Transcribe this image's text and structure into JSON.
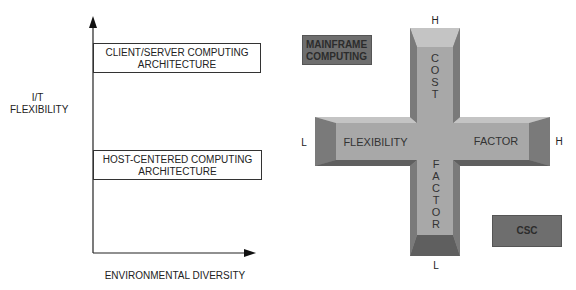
{
  "left_chart": {
    "y_axis_label_line1": "I/T",
    "y_axis_label_line2": "FLEXIBILITY",
    "x_axis_label": "ENVIRONMENTAL DIVERSITY",
    "top_box": {
      "line1": "CLIENT/SERVER COMPUTING",
      "line2": "ARCHITECTURE"
    },
    "bottom_box": {
      "line1": "HOST-CENTERED COMPUTING",
      "line2": "ARCHITECTURE"
    }
  },
  "cross": {
    "top_label": "H",
    "bottom_label": "L",
    "left_label": "L",
    "right_label": "H",
    "vertical_top_text": [
      "C",
      "O",
      "S",
      "T"
    ],
    "vertical_bottom_text": [
      "F",
      "A",
      "C",
      "T",
      "O",
      "R"
    ],
    "horizontal_left_text": "FLEXIBILITY",
    "horizontal_right_text": "FACTOR",
    "colors": {
      "face": "#a8a8a8",
      "light_bevel": "#c4c4c4",
      "dark_bevel": "#6a6a6a",
      "side_bevel": "#8a8a8a"
    }
  },
  "mainframe_box": {
    "line1": "MAINFRAME",
    "line2": "COMPUTING",
    "color": "#6e6e6e"
  },
  "csc_box": {
    "label": "CSC",
    "color": "#6e6e6e"
  }
}
